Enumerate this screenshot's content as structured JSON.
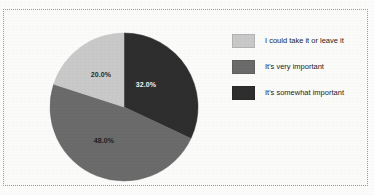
{
  "figure": {
    "background_color": "#fbfbfa",
    "frame_style": "dotted",
    "frame_color": "#9a9a9a"
  },
  "chart_data": {
    "type": "pie",
    "title": "",
    "subtitle": "",
    "xlabel": "",
    "ylabel": "",
    "grid": false,
    "legend_position": "right",
    "start_angle_deg": 90,
    "direction": "clockwise",
    "categories": [
      "It's somewhat important",
      "It's very important",
      "I could take it or leave it"
    ],
    "values": [
      32.0,
      48.0,
      20.0
    ],
    "labels": [
      "32.0%",
      "48.0%",
      "20.0%"
    ],
    "colors": [
      "#2e2e2e",
      "#6b6b6b",
      "#c9c9c9"
    ],
    "label_text_colors": [
      "#f2f2f2",
      "#1d1d1d",
      "#2a2a2a"
    ]
  },
  "legend": {
    "items": [
      {
        "label": "I could take it or leave it",
        "color": "#c9c9c9"
      },
      {
        "label": "It's very important",
        "color": "#6b6b6b"
      },
      {
        "label": "It's somewhat important",
        "color": "#2e2e2e"
      }
    ]
  }
}
